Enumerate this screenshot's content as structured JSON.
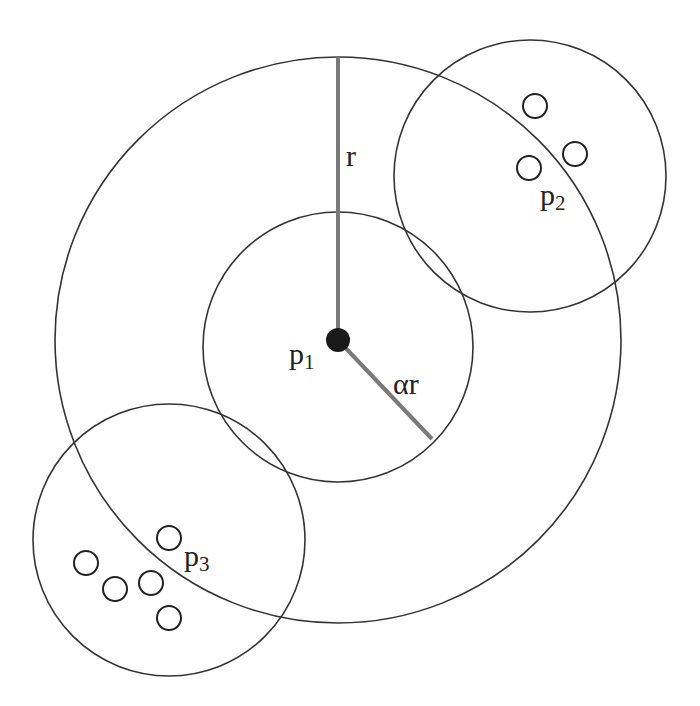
{
  "diagram": {
    "type": "concentric-neighborhood",
    "colors": {
      "stroke": "#333333",
      "radius_line": "#7a7a7a",
      "center_dot": "#1a1a1a",
      "background": "#ffffff"
    },
    "outer_circle": {
      "cx": 338,
      "cy": 340,
      "r": 283
    },
    "inner_circle": {
      "cx": 338,
      "cy": 347,
      "r": 135
    },
    "center_point": {
      "cx": 338,
      "cy": 340,
      "r": 12,
      "label": "p",
      "sub": "1"
    },
    "radius_r": {
      "x1": 338,
      "y1": 57,
      "x2": 338,
      "y2": 340,
      "label": "r"
    },
    "radius_alpha_r": {
      "x1": 338,
      "y1": 340,
      "x2": 432,
      "y2": 439,
      "label": "αr"
    },
    "neighbor_clusters": [
      {
        "circle": {
          "cx": 530,
          "cy": 176,
          "r": 136
        },
        "label": "p",
        "sub": "2",
        "points": [
          {
            "cx": 535,
            "cy": 106
          },
          {
            "cx": 575,
            "cy": 154
          },
          {
            "cx": 529,
            "cy": 168
          }
        ]
      },
      {
        "circle": {
          "cx": 169,
          "cy": 540,
          "r": 136
        },
        "label": "p",
        "sub": "3",
        "points": [
          {
            "cx": 169,
            "cy": 538
          },
          {
            "cx": 86,
            "cy": 563
          },
          {
            "cx": 115,
            "cy": 589
          },
          {
            "cx": 151,
            "cy": 583
          },
          {
            "cx": 169,
            "cy": 618
          }
        ]
      }
    ]
  }
}
